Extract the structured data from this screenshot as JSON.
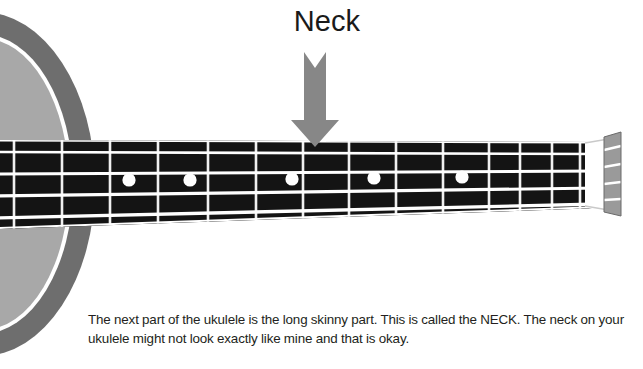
{
  "figure": {
    "title_label": "Neck",
    "caption": "The next part of the ukulele is the long skinny part. This is called the NECK. The neck on your ukulele might not look exactly like mine and that is okay.",
    "subject": "ukulele",
    "highlighted_part": "NECK"
  },
  "colors": {
    "background": "#ffffff",
    "fretboard": "#141414",
    "string": "#ffffff",
    "fret": "#f2f2f2",
    "inlay_dot": "#ffffff",
    "body_outer_ring": "#6e6e6e",
    "body_inner": "#a8a8a8",
    "body_stripe": "#ffffff",
    "arrow": "#878787",
    "nut": "#9a9a9a",
    "text": "#231f20"
  },
  "instrument": {
    "body": {
      "name": "ukulele-body",
      "shape": "ellipse",
      "center_x": -18,
      "center_y": 184,
      "radius_x": 113,
      "radius_y": 172,
      "ring_width": 22,
      "stripe_width": 4
    },
    "fretboard": {
      "name": "ukulele-fretboard",
      "left_x": 0,
      "right_x": 601,
      "left_top_y": 140,
      "left_bottom_y": 229,
      "right_top_y": 142,
      "right_bottom_y": 208,
      "string_count": 4,
      "fret_count": 14
    },
    "frets": {
      "positions_x": [
        14,
        62,
        110,
        158,
        208,
        256,
        303,
        349,
        396,
        443,
        489,
        520,
        552,
        580
      ]
    },
    "strings": {
      "labels": [
        "string-1",
        "string-2",
        "string-3",
        "string-4"
      ],
      "left_y": [
        152,
        175,
        197,
        219
      ],
      "right_y": [
        154,
        171,
        188,
        204
      ]
    },
    "inlay_dots": {
      "count": 5,
      "positions": [
        {
          "x": 129,
          "y": 180,
          "r": 6.5
        },
        {
          "x": 190,
          "y": 180,
          "r": 6.5
        },
        {
          "x": 292,
          "y": 179,
          "r": 6.5
        },
        {
          "x": 374,
          "y": 178,
          "r": 6.5
        },
        {
          "x": 462,
          "y": 177,
          "r": 6.5
        }
      ]
    },
    "nut": {
      "name": "ukulele-nut",
      "x_left": 601,
      "x_right": 620,
      "top_y": 134,
      "bottom_y": 214,
      "slot_count": 4
    }
  },
  "annotation": {
    "arrow": {
      "name": "neck-pointer-arrow",
      "direction": "down",
      "tip_x": 315,
      "tip_y": 147,
      "top_y": 52,
      "shaft_width": 22,
      "head_width": 48,
      "notch_depth": 14
    }
  }
}
